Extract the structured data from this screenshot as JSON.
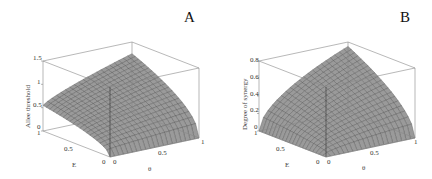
{
  "chart_data": [
    {
      "type": "surface3d",
      "panel_label": "A",
      "title": "",
      "xlabel": "θ",
      "ylabel": "E",
      "zlabel": "Allee threshold",
      "x_ticks": [
        "0",
        "0.5",
        "1"
      ],
      "y_ticks": [
        "0",
        "0.5",
        "1"
      ],
      "z_ticks": [
        "0",
        "0.5",
        "1",
        "1.5"
      ],
      "xlim": [
        0,
        1
      ],
      "ylim": [
        0,
        1
      ],
      "zlim": [
        0,
        1.5
      ],
      "grid_resolution": 21,
      "corner_values": {
        "theta0_E0": 0,
        "theta1_E0": 0,
        "theta0_E1": 0.55,
        "theta1_E1": 1.25
      },
      "surface_color": "#9a9a9a",
      "description": "Surface rising from 0 at E=0 to ~0.55 at (θ=0,E=1) and ~1.25 at (θ=1,E=1); concave in E"
    },
    {
      "type": "surface3d",
      "panel_label": "B",
      "title": "",
      "xlabel": "θ",
      "ylabel": "E",
      "zlabel": "Degree of synergy",
      "x_ticks": [
        "0",
        "0.5",
        "1"
      ],
      "y_ticks": [
        "0",
        "0.5",
        "1"
      ],
      "z_ticks": [
        "0",
        "0.2",
        "0.4",
        "0.6",
        "0.8"
      ],
      "xlim": [
        0,
        1
      ],
      "ylim": [
        0,
        1
      ],
      "zlim": [
        0,
        0.8
      ],
      "grid_resolution": 21,
      "corner_values": {
        "theta0_E0": 0,
        "theta1_E0": 0,
        "theta0_E1": 0,
        "theta1_E1": 0.75
      },
      "surface_color": "#9a9a9a",
      "description": "Surface zero along θ=0 and E=0 edges, rising to ~0.75 at (θ=1,E=1); concave (sqrt-like) shape"
    }
  ],
  "panels": {
    "a": {
      "label": "A",
      "zlabel": "Allee threshold",
      "xlabel": "θ",
      "ylabel": "E",
      "z_ticks": [
        "0",
        "0.5",
        "1",
        "1.5"
      ],
      "e_ticks": [
        "1",
        "0.5",
        "0"
      ],
      "t_ticks": [
        "0",
        "0.5",
        "1"
      ]
    },
    "b": {
      "label": "B",
      "zlabel": "Degree of synergy",
      "xlabel": "θ",
      "ylabel": "E",
      "z_ticks": [
        "0",
        "0.2",
        "0.4",
        "0.6",
        "0.8"
      ],
      "e_ticks": [
        "1",
        "0.5",
        "0"
      ],
      "t_ticks": [
        "0",
        "0.5",
        "1"
      ]
    }
  }
}
